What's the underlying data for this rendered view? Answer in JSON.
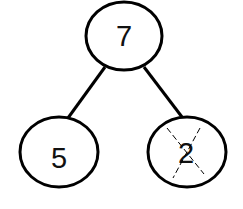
{
  "diagram": {
    "type": "number-bond",
    "stroke_color": "#000000",
    "background": "#ffffff",
    "nodes": [
      {
        "id": "whole",
        "label": "7",
        "cx": 124,
        "cy": 36,
        "rx": 38,
        "ry": 34,
        "crossed_out": false
      },
      {
        "id": "part-left",
        "label": "5",
        "cx": 59,
        "cy": 152,
        "rx": 39,
        "ry": 35,
        "crossed_out": false
      },
      {
        "id": "part-right",
        "label": "2",
        "cx": 187,
        "cy": 152,
        "rx": 39,
        "ry": 35,
        "crossed_out": true
      }
    ],
    "edges": [
      {
        "from": "whole",
        "to": "part-left"
      },
      {
        "from": "whole",
        "to": "part-right"
      }
    ]
  }
}
